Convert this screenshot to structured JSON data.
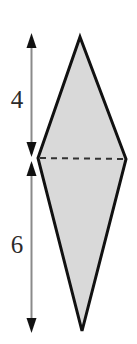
{
  "figure": {
    "kind": "geometry-diagram",
    "background_color": "#ffffff"
  },
  "shape": {
    "name": "kite",
    "fill_color": "#d9d9d9",
    "stroke_color": "#111111",
    "stroke_width": 3,
    "vertices": {
      "top": {
        "x": 80,
        "y": 37
      },
      "right": {
        "x": 126,
        "y": 159
      },
      "bottom": {
        "x": 82,
        "y": 331
      },
      "left": {
        "x": 38,
        "y": 158
      }
    }
  },
  "diagonal": {
    "name": "horizontal-diagonal",
    "style": "dashed",
    "stroke_color": "#333333",
    "stroke_width": 2,
    "dash_pattern": "6 5",
    "from": {
      "x": 40,
      "y": 158
    },
    "to": {
      "x": 124,
      "y": 159
    }
  },
  "dimensions": {
    "axis_x": 31,
    "line_color": "#8a8a8a",
    "arrow_color": "#111111",
    "upper": {
      "label": "4",
      "top_y": 36,
      "bottom_y": 157
    },
    "lower": {
      "label": "6",
      "top_y": 161,
      "bottom_y": 332
    }
  },
  "chart_data": {
    "type": "diagram",
    "title": "",
    "annotations": [
      {
        "text": "4",
        "meaning": "upper height of kite above horizontal diagonal"
      },
      {
        "text": "6",
        "meaning": "lower height of kite below horizontal diagonal"
      }
    ],
    "values": [
      4,
      6
    ],
    "categories": [
      "upper segment",
      "lower segment"
    ]
  }
}
